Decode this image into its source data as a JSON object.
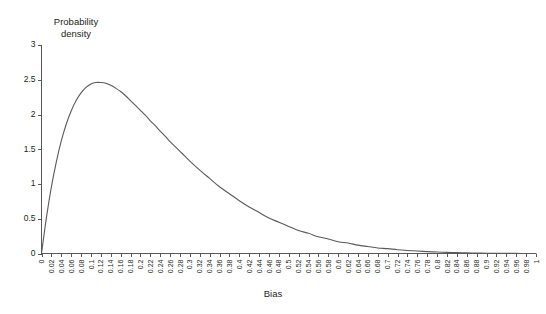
{
  "chart_data": {
    "type": "line",
    "title": "",
    "subtitle": "",
    "xlabel": "Bias",
    "ylabel": "Probability density",
    "ylabel_line1": "Probability",
    "ylabel_line2": "density",
    "xlim": [
      0,
      1
    ],
    "ylim": [
      0,
      3
    ],
    "grid": false,
    "legend": "none",
    "line_color": "#5a5a5c",
    "axis_color": "#58585a",
    "text_color": "#231f20",
    "yticks": [
      0,
      0.5,
      1,
      1.5,
      2,
      2.5,
      3
    ],
    "ytick_labels": [
      "0",
      "0.5",
      "1",
      "1.5",
      "2",
      "2.5",
      "3"
    ],
    "xticks": [
      0,
      0.02,
      0.04,
      0.06,
      0.08,
      0.1,
      0.12,
      0.14,
      0.16,
      0.18,
      0.2,
      0.22,
      0.24,
      0.26,
      0.28,
      0.3,
      0.32,
      0.34,
      0.36,
      0.38,
      0.4,
      0.42,
      0.44,
      0.46,
      0.48,
      0.5,
      0.52,
      0.54,
      0.56,
      0.58,
      0.6,
      0.62,
      0.64,
      0.66,
      0.68,
      0.7,
      0.72,
      0.74,
      0.76,
      0.78,
      0.8,
      0.82,
      0.84,
      0.86,
      0.88,
      0.9,
      0.92,
      0.94,
      0.96,
      0.98,
      1
    ],
    "xtick_labels": [
      "0",
      "0.02",
      "0.04",
      "0.06",
      "0.08",
      "0.1",
      "0.12",
      "0.14",
      "0.16",
      "0.18",
      "0.2",
      "0.22",
      "0.24",
      "0.26",
      "0.28",
      "0.3",
      "0.32",
      "0.34",
      "0.36",
      "0.38",
      "0.4",
      "0.42",
      "0.44",
      "0.46",
      "0.48",
      "0.5",
      "0.52",
      "0.54",
      "0.56",
      "0.58",
      "0.6",
      "0.62",
      "0.64",
      "0.66",
      "0.68",
      "0.7",
      "0.72",
      "0.74",
      "0.76",
      "0.78",
      "0.8",
      "0.82",
      "0.84",
      "0.86",
      "0.88",
      "0.9",
      "0.92",
      "0.94",
      "0.96",
      "0.98",
      "1"
    ],
    "xtick_label_rotation": -90,
    "series": [
      {
        "name": "Probability density",
        "x": [
          0,
          0.01,
          0.02,
          0.03,
          0.04,
          0.05,
          0.06,
          0.07,
          0.08,
          0.09,
          0.1,
          0.11,
          0.12,
          0.13,
          0.14,
          0.15,
          0.16,
          0.17,
          0.18,
          0.19,
          0.2,
          0.21,
          0.22,
          0.23,
          0.24,
          0.25,
          0.26,
          0.27,
          0.28,
          0.29,
          0.3,
          0.32,
          0.34,
          0.36,
          0.38,
          0.4,
          0.42,
          0.44,
          0.46,
          0.48,
          0.5,
          0.52,
          0.54,
          0.56,
          0.58,
          0.6,
          0.62,
          0.64,
          0.66,
          0.68,
          0.7,
          0.72,
          0.74,
          0.76,
          0.78,
          0.8,
          0.82,
          0.84,
          0.86,
          0.88,
          0.9,
          0.92,
          0.94,
          0.96,
          0.98,
          1
        ],
        "y": [
          0,
          0.52,
          0.96,
          1.32,
          1.62,
          1.86,
          2.05,
          2.2,
          2.31,
          2.39,
          2.44,
          2.46,
          2.46,
          2.45,
          2.42,
          2.38,
          2.33,
          2.27,
          2.2,
          2.13,
          2.06,
          1.99,
          1.91,
          1.84,
          1.76,
          1.69,
          1.61,
          1.54,
          1.47,
          1.4,
          1.33,
          1.2,
          1.08,
          0.96,
          0.86,
          0.76,
          0.67,
          0.59,
          0.51,
          0.45,
          0.39,
          0.33,
          0.29,
          0.24,
          0.21,
          0.17,
          0.15,
          0.12,
          0.1,
          0.08,
          0.07,
          0.055,
          0.044,
          0.035,
          0.027,
          0.021,
          0.016,
          0.012,
          0.009,
          0.0065,
          0.0046,
          0.0031,
          0.002,
          0.0012,
          0.0005,
          0
        ]
      }
    ],
    "peak": {
      "x": 0.205,
      "y": 2.46
    }
  }
}
